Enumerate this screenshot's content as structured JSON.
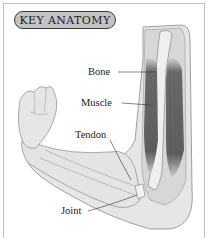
{
  "title": "KEY ANATOMY",
  "labels": {
    "bone": "Bone",
    "muscle": "Muscle",
    "tendon": "Tendon",
    "joint": "Joint"
  },
  "colors": {
    "title_pill_fill": "#c4c4c4",
    "title_pill_border": "#3a3a3a",
    "skin": "#e6e6e6",
    "muscle": "#6a6a6a",
    "outline": "#8a8a8a",
    "frame": "#bdbdbd"
  }
}
